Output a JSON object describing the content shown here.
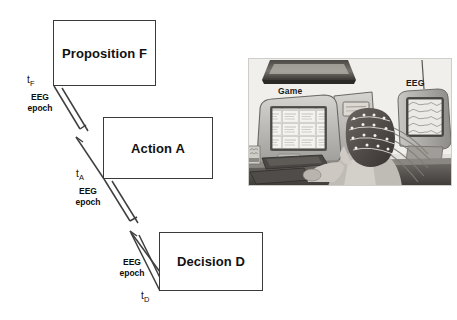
{
  "figure": {
    "type": "flow-diagram-with-photograph",
    "background_color": "#ffffff",
    "line_color": "#3f3f3f"
  },
  "diagram": {
    "nodes": [
      {
        "id": "proposition",
        "label": "Proposition F"
      },
      {
        "id": "action",
        "label": "Action A"
      },
      {
        "id": "decision",
        "label": "Decision D"
      }
    ],
    "time_markers": [
      {
        "id": "t-f",
        "base": "t",
        "subscript": "F"
      },
      {
        "id": "t-a",
        "base": "t",
        "subscript": "A"
      },
      {
        "id": "t-d",
        "base": "t",
        "subscript": "D"
      }
    ],
    "epochs": [
      {
        "id": "epoch-f",
        "line1": "EEG",
        "line2": "epoch"
      },
      {
        "id": "epoch-a",
        "line1": "EEG",
        "line2": "epoch"
      },
      {
        "id": "epoch-d",
        "line1": "EEG",
        "line2": "epoch"
      }
    ]
  },
  "photo": {
    "alt_description": "Grayscale photograph of a person wearing an EEG electrode cap seated at a desk, using a mouse in front of a computer monitor displaying a game, with a second monitor showing EEG traces",
    "captions": {
      "game": "Game",
      "eeg": "EEG"
    }
  }
}
